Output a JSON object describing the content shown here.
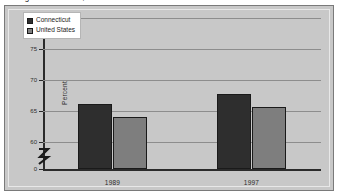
{
  "title_strip": {
    "text": "Figure — Percent, Connecticut and United States"
  },
  "legend": {
    "position": "top-left-inside",
    "entries": [
      {
        "label": "Connecticut",
        "color": "#2e2e2e"
      },
      {
        "label": "United States",
        "color": "#7e7e7e"
      }
    ]
  },
  "axis": {
    "y_title": "Percent",
    "tick_labels": [
      "80",
      "75",
      "70",
      "65",
      "60",
      "0"
    ],
    "break_icon": "axis-break-zigzag"
  },
  "chart_data": {
    "type": "bar",
    "title": "",
    "xlabel": "",
    "ylabel": "Percent",
    "categories": [
      "1989",
      "1997"
    ],
    "series": [
      {
        "name": "Connecticut",
        "values": [
          66.2,
          67.8
        ],
        "color": "#2e2e2e"
      },
      {
        "name": "United States",
        "values": [
          64.0,
          65.6
        ],
        "color": "#7e7e7e"
      }
    ],
    "ylim": [
      60,
      80
    ],
    "yticks": [
      60,
      65,
      70,
      75,
      80
    ],
    "y_axis_break": true,
    "y_axis_break_between": [
      0,
      60
    ],
    "grid": true,
    "legend_position": "upper left"
  }
}
